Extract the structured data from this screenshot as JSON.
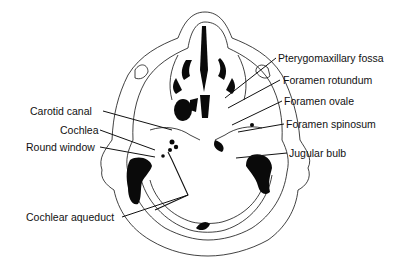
{
  "diagram": {
    "type": "anatomical-line-drawing",
    "colors": {
      "line": "#111111",
      "fill_dark": "#0a0a0a",
      "background": "#ffffff"
    }
  },
  "labels": {
    "left": [
      {
        "id": "carotid-canal",
        "text": "Carotid canal"
      },
      {
        "id": "cochlea",
        "text": "Cochlea"
      },
      {
        "id": "round-window",
        "text": "Round window"
      },
      {
        "id": "cochlear-aqueduct",
        "text": "Cochlear aqueduct"
      }
    ],
    "right": [
      {
        "id": "pterygomaxillary-fossa",
        "text": "Pterygomaxillary fossa"
      },
      {
        "id": "foramen-rotundum",
        "text": "Foramen rotundum"
      },
      {
        "id": "foramen-ovale",
        "text": "Foramen ovale"
      },
      {
        "id": "foramen-spinosum",
        "text": "Foramen spinosum"
      },
      {
        "id": "jugular-bulb",
        "text": "Jugular bulb"
      }
    ]
  }
}
